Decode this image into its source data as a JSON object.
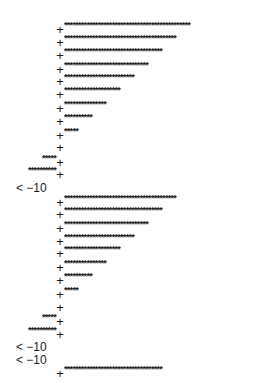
{
  "chart_data": {
    "type": "bar",
    "orientation": "horizontal",
    "style": "ascii-histogram",
    "title": "",
    "xlabel": "",
    "ylabel": "",
    "bar_char": "*",
    "axis_char": "+",
    "underflow_label": "< −10",
    "grid": false,
    "legend": null,
    "series": [
      {
        "name": "group-1",
        "values": [
          45,
          40,
          35,
          30,
          25,
          20,
          15,
          10,
          5,
          0,
          -5,
          -10,
          "< -10"
        ]
      },
      {
        "name": "group-2",
        "values": [
          40,
          35,
          30,
          25,
          20,
          15,
          10,
          5,
          0,
          -5,
          -10,
          "< -10",
          "< -10",
          35
        ]
      }
    ]
  },
  "rows": [
    {
      "y": 23,
      "value": 45
    },
    {
      "y": 36,
      "value": 40
    },
    {
      "y": 49,
      "value": 35
    },
    {
      "y": 63,
      "value": 30
    },
    {
      "y": 75,
      "value": 25
    },
    {
      "y": 88,
      "value": 20
    },
    {
      "y": 102,
      "value": 15
    },
    {
      "y": 115,
      "value": 10
    },
    {
      "y": 129,
      "value": 5
    },
    {
      "y": 141,
      "value": 0
    },
    {
      "y": 156,
      "value": -5
    },
    {
      "y": 168,
      "value": -10
    },
    {
      "y": 182,
      "label": "< −10"
    },
    {
      "y": 196,
      "value": 40
    },
    {
      "y": 208,
      "value": 35
    },
    {
      "y": 222,
      "value": 30
    },
    {
      "y": 235,
      "value": 25
    },
    {
      "y": 247,
      "value": 20
    },
    {
      "y": 261,
      "value": 15
    },
    {
      "y": 274,
      "value": 10
    },
    {
      "y": 288,
      "value": 5
    },
    {
      "y": 301,
      "value": 0
    },
    {
      "y": 315,
      "value": -5
    },
    {
      "y": 328,
      "value": -10
    },
    {
      "y": 341,
      "label": "< −10"
    },
    {
      "y": 354,
      "label": "< −10"
    },
    {
      "y": 367,
      "value": 35
    }
  ]
}
